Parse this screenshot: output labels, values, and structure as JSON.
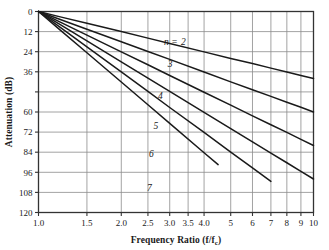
{
  "chart_data": {
    "type": "line",
    "title": "",
    "xlabel": "Frequency Ratio (f/f_c)",
    "ylabel": "Attenuation (dB)",
    "x_scale": "log",
    "y_scale": "linear",
    "xlim": [
      1.0,
      10.0
    ],
    "ylim": [
      120,
      0
    ],
    "y_inverted": true,
    "grid": true,
    "legend_position": "inline-on-curves",
    "x_ticks": [
      1.0,
      1.5,
      2.0,
      2.5,
      3.0,
      3.5,
      4.0,
      5,
      6,
      7,
      8,
      9,
      10
    ],
    "x_tick_labels": [
      "1.0",
      "1.5",
      "2.0",
      "2.5",
      "3.0",
      "3.5",
      "4.0",
      "5",
      "6",
      "7",
      "8",
      "9",
      "10"
    ],
    "y_ticks": [
      0,
      12,
      24,
      36,
      48,
      60,
      72,
      84,
      96,
      108,
      120
    ],
    "y_tick_labels": [
      "0",
      "12",
      "24",
      "36",
      "",
      "60",
      "72",
      "84",
      "96",
      "108",
      "120"
    ],
    "annotation_n_equals": "n =",
    "series": [
      {
        "name": "2",
        "label": "2",
        "order": 2,
        "x": [
          1.0,
          1.2,
          1.5,
          2.0,
          2.5,
          3.0,
          4.0,
          5.0,
          6.0,
          7.0,
          8.0,
          9.0,
          10.0
        ],
        "y": [
          0.0,
          3.2,
          7.0,
          12.0,
          15.9,
          19.1,
          24.1,
          28.0,
          31.1,
          33.8,
          36.1,
          38.2,
          40.0
        ]
      },
      {
        "name": "3",
        "label": "3",
        "order": 3,
        "x": [
          1.0,
          1.2,
          1.5,
          2.0,
          2.5,
          3.0,
          4.0,
          5.0,
          6.0,
          7.0,
          8.0,
          9.0,
          10.0
        ],
        "y": [
          0.0,
          4.8,
          10.6,
          18.1,
          23.9,
          28.6,
          36.1,
          42.0,
          46.7,
          50.7,
          54.2,
          57.2,
          60.0
        ]
      },
      {
        "name": "4",
        "label": "4",
        "order": 4,
        "x": [
          1.0,
          1.2,
          1.5,
          2.0,
          2.5,
          3.0,
          4.0,
          5.0,
          6.0,
          7.0,
          8.0,
          9.0,
          10.0
        ],
        "y": [
          0.0,
          6.3,
          14.1,
          24.1,
          31.8,
          38.2,
          48.2,
          55.9,
          62.3,
          67.6,
          72.2,
          76.3,
          80.0
        ]
      },
      {
        "name": "5",
        "label": "5",
        "order": 5,
        "x": [
          1.0,
          1.2,
          1.5,
          2.0,
          2.5,
          3.0,
          4.0,
          5.0,
          6.0,
          7.0,
          8.0,
          9.0,
          10.0
        ],
        "y": [
          0.0,
          7.9,
          17.6,
          30.1,
          39.8,
          47.7,
          60.2,
          69.9,
          77.8,
          84.5,
          90.3,
          95.4,
          100.0
        ]
      },
      {
        "name": "6",
        "label": "6",
        "order": 6,
        "x": [
          1.0,
          1.2,
          1.5,
          2.0,
          2.5,
          3.0,
          4.0,
          5.0,
          6.0,
          7.0
        ],
        "y": [
          0.0,
          9.5,
          21.1,
          36.1,
          47.7,
          57.3,
          72.2,
          83.9,
          93.4,
          101.4
        ]
      },
      {
        "name": "7",
        "label": "7",
        "order": 7,
        "x": [
          1.0,
          1.2,
          1.5,
          2.0,
          2.5,
          3.0,
          4.0,
          4.5
        ],
        "y": [
          0.0,
          11.1,
          24.6,
          42.1,
          55.7,
          66.8,
          84.3,
          91.4
        ]
      }
    ],
    "curve_label_positions": [
      {
        "label": "2",
        "x": 3.3,
        "y": 20.0
      },
      {
        "label": "3",
        "x": 2.95,
        "y": 33.0
      },
      {
        "label": "4",
        "x": 2.72,
        "y": 52.0
      },
      {
        "label": "5",
        "x": 2.62,
        "y": 70.0
      },
      {
        "label": "6",
        "x": 2.52,
        "y": 87.0
      },
      {
        "label": "7",
        "x": 2.48,
        "y": 107.0
      }
    ],
    "equation": "A = 20 n log10(f/fc)"
  },
  "labels": {
    "x_axis_title_main": "Frequency Ratio (f/f",
    "x_axis_title_sub": "c",
    "x_axis_title_close": ")",
    "y_axis_title": "Attenuation (dB)",
    "n_prefix": "n ="
  },
  "colors": {
    "background": "#ffffff",
    "curve": "#1a1a1a",
    "grid": "#8c8c8c",
    "axis": "#333333",
    "text": "#1a1a1a"
  }
}
